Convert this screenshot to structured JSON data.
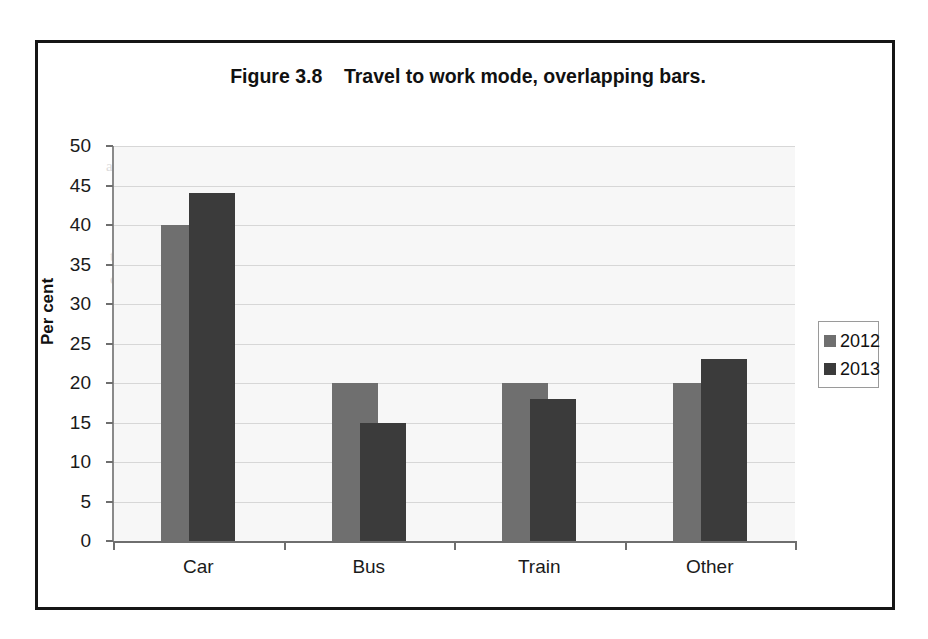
{
  "figure": {
    "title": "Figure 3.8    Travel to work mode, overlapping bars.",
    "frame_border_color": "#161616",
    "plot_background_color": "#f7f7f7"
  },
  "ghost_text": {
    "line1": "ally the heights of the bars should start at",
    "line2": "time series. It is no accident that the most",
    "line3": "common measures used to display data"
  },
  "chart_data": {
    "type": "bar",
    "title": "Figure 3.8    Travel to work mode, overlapping bars.",
    "subtype": "overlapping-bars",
    "xlabel": "",
    "ylabel": "Per cent",
    "categories": [
      "Car",
      "Bus",
      "Train",
      "Other"
    ],
    "series": [
      {
        "name": "2012",
        "color": "#6f6f6f",
        "values": [
          40,
          20,
          20,
          20
        ]
      },
      {
        "name": "2013",
        "color": "#3b3b3b",
        "values": [
          44,
          15,
          18,
          23
        ]
      }
    ],
    "ylim": [
      0,
      50
    ],
    "y_ticks": [
      0,
      5,
      10,
      15,
      20,
      25,
      30,
      35,
      40,
      45,
      50
    ],
    "y_tick_labels": [
      "0",
      "5",
      "10",
      "15",
      "20",
      "25",
      "30",
      "35",
      "40",
      "45",
      "50"
    ],
    "grid": true,
    "grid_axis": "y",
    "legend_position": "right",
    "legend_entries": [
      "2012",
      "2013"
    ]
  }
}
